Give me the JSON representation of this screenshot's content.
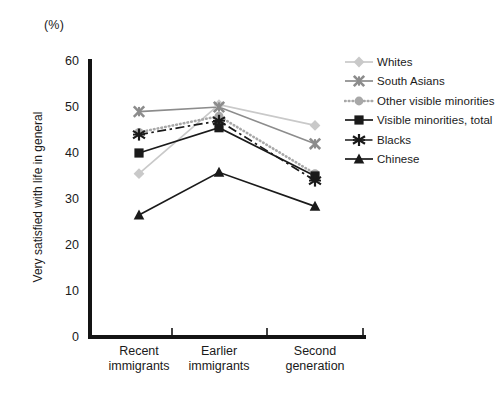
{
  "chart_data": {
    "type": "line",
    "title": "",
    "unit_label": "(%)",
    "xlabel": "",
    "ylabel": "Very satisfied with life in general",
    "categories": [
      "Recent\nimmigrants",
      "Earlier\nimmigrants",
      "Second\ngeneration"
    ],
    "category_lines": [
      [
        "Recent",
        "immigrants"
      ],
      [
        "Earlier",
        "immigrants"
      ],
      [
        "Second",
        "generation"
      ]
    ],
    "ylim": [
      0,
      60
    ],
    "yticks": [
      0,
      10,
      20,
      30,
      40,
      50,
      60
    ],
    "ytick_labels": [
      "0",
      "10",
      "20",
      "30",
      "40",
      "50",
      "60"
    ],
    "grid": false,
    "legend_position": "right",
    "series": [
      {
        "name": "Whites",
        "values": [
          35.5,
          50.5,
          46.0
        ],
        "color": "#c9c9c9",
        "marker": "diamond",
        "linestyle": "solid"
      },
      {
        "name": "South Asians",
        "values": [
          49.0,
          50.0,
          42.0
        ],
        "color": "#8c8c8c",
        "marker": "cross",
        "linestyle": "solid"
      },
      {
        "name": "Other visible minorities",
        "values": [
          44.5,
          48.0,
          35.5
        ],
        "color": "#a8a8a8",
        "marker": "circle",
        "linestyle": "dotted"
      },
      {
        "name": "Visible minorities, total",
        "values": [
          40.0,
          45.5,
          35.0
        ],
        "color": "#1a1a1a",
        "marker": "square",
        "linestyle": "solid"
      },
      {
        "name": "Blacks",
        "values": [
          44.0,
          47.0,
          34.0
        ],
        "color": "#1a1a1a",
        "marker": "asterisk",
        "linestyle": "dashdot"
      },
      {
        "name": "Chinese",
        "values": [
          26.5,
          35.8,
          28.4
        ],
        "color": "#1a1a1a",
        "marker": "triangle",
        "linestyle": "solid"
      }
    ]
  },
  "legend": {
    "items": [
      {
        "label": "Whites"
      },
      {
        "label": "South Asians"
      },
      {
        "label": "Other visible minorities"
      },
      {
        "label": "Visible minorities, total"
      },
      {
        "label": "Blacks"
      },
      {
        "label": "Chinese"
      }
    ]
  }
}
